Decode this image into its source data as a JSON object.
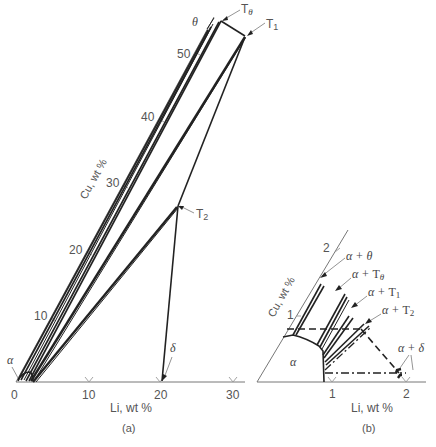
{
  "figure": {
    "panel_a": {
      "caption": "(a)",
      "x_axis": {
        "label": "Li, wt %",
        "ticks": [
          "0",
          "10",
          "20",
          "30"
        ]
      },
      "y_axis": {
        "label": "Cu, wt %",
        "ticks": [
          "10",
          "20",
          "30",
          "40",
          "50"
        ]
      },
      "phase_labels": {
        "alpha": "α",
        "theta": "θ",
        "t_theta": "Tθ",
        "t1": "T1",
        "t2": "T2",
        "delta": "δ"
      }
    },
    "panel_b": {
      "caption": "(b)",
      "x_axis": {
        "label": "Li, wt %",
        "ticks": [
          "1",
          "2"
        ]
      },
      "y_axis": {
        "label": "Cu, wt %",
        "ticks": [
          "1",
          "2"
        ]
      },
      "region_labels": {
        "alpha": "α",
        "alpha_theta": "α + θ",
        "alpha_t_theta": "α + Tθ",
        "alpha_t1": "α + T1",
        "alpha_t2": "α + T2",
        "alpha_delta": "α + δ"
      }
    }
  }
}
